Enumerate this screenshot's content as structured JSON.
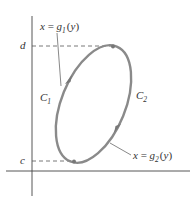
{
  "figure": {
    "type": "region-between-curves-y",
    "labels": {
      "upper_bound": "d",
      "lower_bound": "c",
      "curve_left": {
        "base": "C",
        "sub": "1"
      },
      "curve_right": {
        "base": "C",
        "sub": "2"
      },
      "left_function": {
        "lhs": "x",
        "eq": "=",
        "fn": "g",
        "sub": "1",
        "open": "(",
        "var": "y",
        "close": ")"
      },
      "right_function": {
        "lhs": "x",
        "eq": "=",
        "fn": "g",
        "sub": "2",
        "open": "(",
        "var": "y",
        "close": ")"
      }
    },
    "colors": {
      "axis": "#444444",
      "curve": "#8a8a8a",
      "dash": "#555555",
      "text": "#333333",
      "leader": "#555555"
    },
    "orientation": "counterclockwise"
  }
}
